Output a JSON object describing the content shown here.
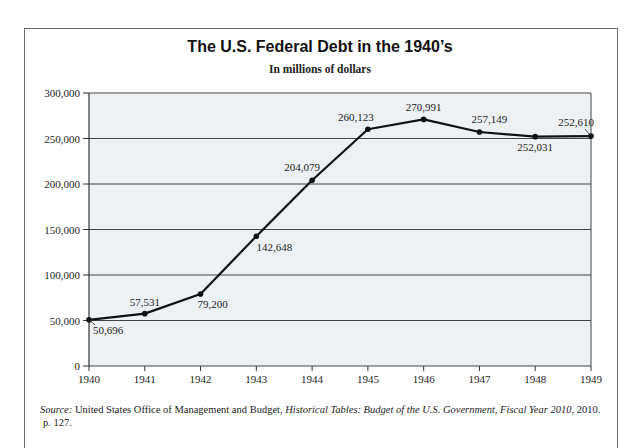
{
  "title": "The U.S. Federal Debt in the 1940’s",
  "subtitle": "In millions of dollars",
  "source": {
    "label": "Source:",
    "text1": " United States Office of Management and Budget, ",
    "italic": "Historical Tables: Budget of the U.S. Government, Fiscal Year 2010,",
    "text2": " 2010.",
    "text3": "p. 127."
  },
  "colors": {
    "plot_bg": "#eef1f3",
    "line": "#111111",
    "grid": "#444444"
  },
  "chart_data": {
    "type": "line",
    "title": "The U.S. Federal Debt in the 1940’s",
    "subtitle": "In millions of dollars",
    "xlabel": "",
    "ylabel": "",
    "categories": [
      "1940",
      "1941",
      "1942",
      "1943",
      "1944",
      "1945",
      "1946",
      "1947",
      "1948",
      "1949"
    ],
    "series": [
      {
        "name": "Federal Debt",
        "values": [
          50696,
          57531,
          79200,
          142648,
          204079,
          260123,
          270991,
          257149,
          252031,
          252610
        ]
      }
    ],
    "data_labels": [
      "50,696",
      "57,531",
      "79,200",
      "142,648",
      "204,079",
      "260,123",
      "270,991",
      "257,149",
      "252,031",
      "252,610"
    ],
    "yticks": [
      0,
      50000,
      100000,
      150000,
      200000,
      250000,
      300000
    ],
    "ytick_labels": [
      "0",
      "50,000",
      "100,000",
      "150,000",
      "200,000",
      "250,000",
      "300,000"
    ],
    "ylim": [
      0,
      300000
    ],
    "grid": true,
    "legend": "none"
  }
}
